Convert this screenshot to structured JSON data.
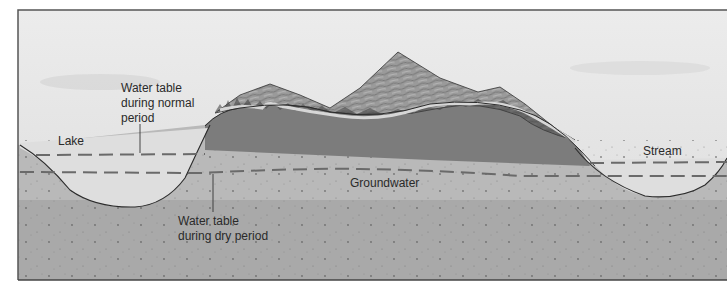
{
  "diagram": {
    "type": "geologic cross-section",
    "labels": {
      "normal_table": {
        "line1": "Water table",
        "line2": "during normal",
        "line3": "period"
      },
      "lake": "Lake",
      "groundwater": "Groundwater",
      "dry_table": {
        "line1": "Water table",
        "line2": "during dry period"
      },
      "stream": "Stream"
    },
    "colors": {
      "sky": "#e4e4e4",
      "water": "#dedede",
      "upper_ground": "#b9b9b9",
      "lower_ground": "#aaaaaa",
      "saturated_dark": "#7a7a7a",
      "mountain": "#8f8f8f",
      "outline": "#2b2b2b",
      "dashed_line": "#6a6a6a",
      "frame": "#555555"
    },
    "elements": [
      "sky",
      "mountains with forest",
      "lake",
      "stream",
      "groundwater zone",
      "normal water table (dashed)",
      "dry water table (dashed)"
    ]
  }
}
